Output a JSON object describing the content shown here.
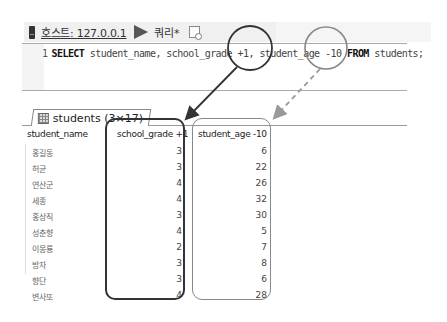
{
  "toolbar": {
    "host_label": "호스트: 127.0.0.1",
    "query_tab_label": "쿼리*",
    "icons": [
      "server-icon",
      "play-icon",
      "new-query-tab-icon"
    ]
  },
  "editor": {
    "line_number": "1",
    "tokens": {
      "select": "SELECT",
      "part1": " student_name, school_grade ",
      "plus": "+1,",
      "part2": " student_age ",
      "minus": "-10",
      "from": "FROM",
      "part3": " students;"
    }
  },
  "results_tab": {
    "label": "students (3×17)"
  },
  "table": {
    "columns": [
      "student_name",
      "school_grade +1",
      "student_age -10"
    ],
    "rows": [
      {
        "name": "홍길동",
        "grade": "3",
        "age": "6"
      },
      {
        "name": "허균",
        "grade": "3",
        "age": "22"
      },
      {
        "name": "연산군",
        "grade": "4",
        "age": "26"
      },
      {
        "name": "세종",
        "grade": "4",
        "age": "32"
      },
      {
        "name": "홍상직",
        "grade": "3",
        "age": "30"
      },
      {
        "name": "성춘향",
        "grade": "4",
        "age": "5"
      },
      {
        "name": "이몽룡",
        "grade": "2",
        "age": "7"
      },
      {
        "name": "방자",
        "grade": "3",
        "age": "8"
      },
      {
        "name": "향단",
        "grade": "3",
        "age": "6"
      },
      {
        "name": "변사또",
        "grade": "4",
        "age": "28"
      }
    ]
  },
  "annotations": {
    "grade_highlight_color": "#333333",
    "age_highlight_color": "#888888"
  }
}
